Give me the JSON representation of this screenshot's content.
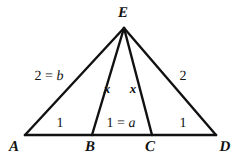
{
  "figure": {
    "type": "geometry-diagram",
    "background_color": "#ffffff",
    "stroke_color": "#111111",
    "vertices": [
      {
        "name": "A",
        "label": "A",
        "x": 25,
        "y": 135,
        "label_x": 14,
        "label_y": 147
      },
      {
        "name": "B",
        "label": "B",
        "x": 92,
        "y": 135,
        "label_x": 90,
        "label_y": 147
      },
      {
        "name": "C",
        "label": "C",
        "x": 152,
        "y": 135,
        "label_x": 150,
        "label_y": 147
      },
      {
        "name": "D",
        "label": "D",
        "x": 216,
        "y": 135,
        "label_x": 225,
        "label_y": 147
      },
      {
        "name": "E",
        "label": "E",
        "x": 124,
        "y": 28,
        "label_x": 123,
        "label_y": 13
      }
    ],
    "edges": [
      {
        "name": "base-AD",
        "from": "A",
        "to": "D",
        "width": 2.4
      },
      {
        "name": "side-AE",
        "from": "A",
        "to": "E",
        "width": 2.4
      },
      {
        "name": "side-ED",
        "from": "E",
        "to": "D",
        "width": 2.4
      },
      {
        "name": "cevian-EB",
        "from": "E",
        "to": "B",
        "width": 2.4
      },
      {
        "name": "cevian-EC",
        "from": "E",
        "to": "C",
        "width": 2.4
      }
    ],
    "segment_labels": [
      {
        "name": "label-side-AE",
        "text": "2 = b",
        "number": "2",
        "equals": "=",
        "variable": "b",
        "x": 49,
        "y": 77
      },
      {
        "name": "label-side-ED",
        "text": "2",
        "number": "2",
        "x": 183,
        "y": 77
      },
      {
        "name": "label-seg-AB",
        "text": "1",
        "number": "1",
        "x": 60,
        "y": 124
      },
      {
        "name": "label-seg-BC",
        "text": "1 = a",
        "number": "1",
        "equals": "=",
        "variable": "a",
        "x": 121,
        "y": 124
      },
      {
        "name": "label-seg-CD",
        "text": "1",
        "number": "1",
        "x": 183,
        "y": 124
      },
      {
        "name": "label-cevian-EB",
        "text": "x",
        "x": 107,
        "y": 88
      },
      {
        "name": "label-cevian-EC",
        "text": "x",
        "x": 133,
        "y": 88
      }
    ]
  }
}
